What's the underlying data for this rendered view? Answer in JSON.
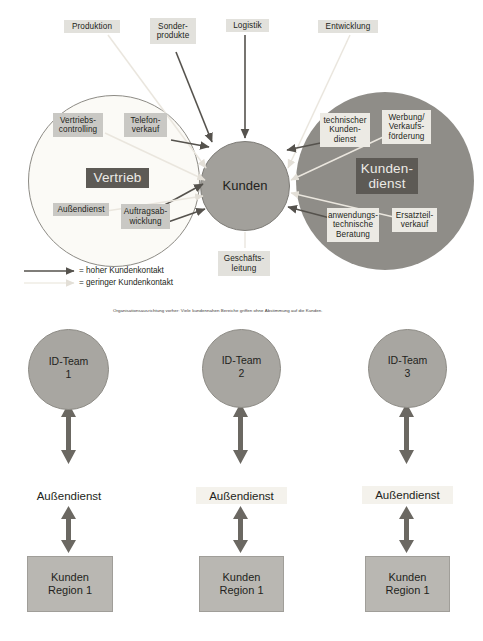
{
  "diagram": {
    "top_departments": [
      {
        "label": "Produktion",
        "contact": "low"
      },
      {
        "label": "Sonder-\nprodukte",
        "contact": "high"
      },
      {
        "label": "Logistik",
        "contact": "high"
      },
      {
        "label": "Entwicklung",
        "contact": "low"
      }
    ],
    "sales_circle": {
      "title": "Vertrieb",
      "units": [
        {
          "label": "Vertriebs-\ncontrolling",
          "contact": "low"
        },
        {
          "label": "Telefon-\nverkauf",
          "contact": "high"
        },
        {
          "label": "Außendienst",
          "contact": "low"
        },
        {
          "label": "Auftragsab-\nwicklung",
          "contact": "high"
        }
      ]
    },
    "service_circle": {
      "title": "Kunden-\ndienst",
      "units": [
        {
          "label": "technischer\nKunden-\ndienst",
          "contact": "high"
        },
        {
          "label": "Werbung/\nVerkaufs-\nförderung",
          "contact": "low"
        },
        {
          "label": "anwendungs-\ntechnische\nBeratung",
          "contact": "high"
        },
        {
          "label": "Ersatzteil-\nverkauf",
          "contact": "low"
        }
      ]
    },
    "center": {
      "label": "Kunden"
    },
    "management": {
      "label": "Geschäfts-\nleitung"
    },
    "legend": [
      {
        "marker": "solid-arrow-icon",
        "text": "= hoher Kundenkontakt"
      },
      {
        "marker": "faint-arrow-icon",
        "text": "= geringer Kundenkontakt"
      }
    ],
    "caption_top": "Organisationsausrichtung vorher: Viele kundennahen Bereiche griffen ohne Abstimmung auf die Kunden."
  },
  "lower": {
    "columns": [
      {
        "team": "ID-Team\n1",
        "field_service": "Außendienst",
        "customer": "Kunden\nRegion 1"
      },
      {
        "team": "ID-Team\n2",
        "field_service": "Außendienst",
        "customer": "Kunden\nRegion 1"
      },
      {
        "team": "ID-Team\n3",
        "field_service": "Außendienst",
        "customer": "Kunden\nRegion 1"
      }
    ]
  },
  "colors": {
    "chip_grey": "#c9c8c4",
    "chip_light": "#e2e1dc",
    "dark_tag": "#5d5a55",
    "service_circle": "#8f8d88",
    "center_circle": "#a2a09b",
    "arrow_dark": "#55524d",
    "arrow_faint": "#e6e2da"
  }
}
